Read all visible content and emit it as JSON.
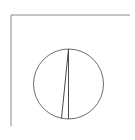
{
  "diagram": {
    "type": "geometry",
    "colors": {
      "background": "#ffffff",
      "frame": "#8a8a8a",
      "circle": "#6e6e6e",
      "lines": "#4a4a4a"
    },
    "frame": {
      "top_line": {
        "x1": 11,
        "y1": 15,
        "x2": 130,
        "y2": 15
      },
      "left_line": {
        "x1": 11,
        "y1": 15,
        "x2": 11,
        "y2": 126
      }
    },
    "circle": {
      "cx": 68.5,
      "cy": 84,
      "r": 35
    },
    "segments": [
      {
        "name": "diameter",
        "x1": 68.5,
        "y1": 49,
        "x2": 68.5,
        "y2": 119
      },
      {
        "name": "chord",
        "x1": 68.5,
        "y1": 49,
        "x2": 61.5,
        "y2": 118.5
      }
    ]
  }
}
